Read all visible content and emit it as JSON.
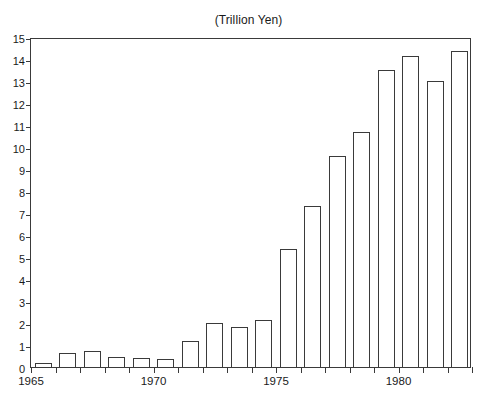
{
  "chart_data": {
    "type": "bar",
    "title": "(Trillion Yen)",
    "xlabel": "",
    "ylabel": "",
    "ylim": [
      0,
      15
    ],
    "ytick_step": 1,
    "yticks": [
      0,
      1,
      2,
      3,
      4,
      5,
      6,
      7,
      8,
      9,
      10,
      11,
      12,
      13,
      14,
      15
    ],
    "grid": false,
    "legend": "none",
    "xtick_labels": [
      "1965",
      "1970",
      "1975",
      "1980"
    ],
    "xtick_label_years": [
      1965,
      1970,
      1975,
      1980
    ],
    "xlim": [
      1965,
      1983
    ],
    "categories": [
      "1965",
      "1966",
      "1967",
      "1968",
      "1969",
      "1970",
      "1971",
      "1972",
      "1973",
      "1974",
      "1975",
      "1976",
      "1977",
      "1978",
      "1979",
      "1980",
      "1981",
      "1982"
    ],
    "values": [
      0.2,
      0.65,
      0.75,
      0.45,
      0.4,
      0.35,
      1.2,
      2.0,
      1.8,
      2.15,
      5.35,
      7.3,
      9.6,
      10.7,
      13.5,
      14.15,
      13.0,
      14.35
    ],
    "bar_facecolor": "#ffffff",
    "bar_edgecolor": "#3a3a3a",
    "background_color": "#ffffff",
    "axis_color": "#3a3a3a"
  }
}
